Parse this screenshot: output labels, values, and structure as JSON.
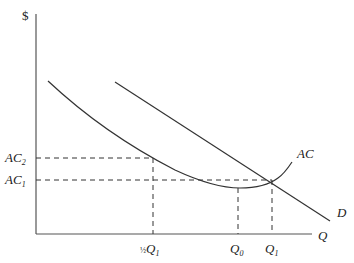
{
  "diagram": {
    "y_axis_label": "$",
    "x_axis_label": "Q",
    "curves": {
      "ac_label": "AC",
      "demand_label": "D"
    },
    "y_ticks": [
      {
        "base": "AC",
        "sub": "2"
      },
      {
        "base": "AC",
        "sub": "1"
      }
    ],
    "x_ticks": [
      {
        "prefix": "½",
        "base": "Q",
        "sub": "1"
      },
      {
        "prefix": "",
        "base": "Q",
        "sub": "0"
      },
      {
        "prefix": "",
        "base": "Q",
        "sub": "1"
      }
    ],
    "colors": {
      "line": "#333333",
      "axis": "#555555"
    }
  }
}
